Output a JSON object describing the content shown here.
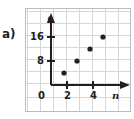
{
  "figure": {
    "part_label": "a)",
    "frame_color": "#b9bcc0",
    "grid_color": "#d5d7da",
    "axis_color": "#231f20",
    "point_color": "#231f20",
    "text_color": "#231f20"
  },
  "chart_data": {
    "type": "scatter",
    "title": "",
    "subtitle": "",
    "xlabel": "n",
    "ylabel": "t",
    "x": [
      1,
      2,
      3,
      4
    ],
    "values": [
      4,
      8,
      12,
      16
    ],
    "points": [
      {
        "n": 1,
        "t": 4
      },
      {
        "n": 2,
        "t": 8
      },
      {
        "n": 3,
        "t": 12
      },
      {
        "n": 4,
        "t": 16
      }
    ],
    "xlim": [
      0,
      5
    ],
    "ylim": [
      0,
      20
    ],
    "xticks": [
      0,
      2,
      4
    ],
    "xtick_labels": [
      "0",
      "2",
      "4"
    ],
    "yticks": [
      8,
      16
    ],
    "ytick_labels": [
      "8",
      "16"
    ],
    "grid": true,
    "grid_step_x": 1,
    "grid_step_y": 4,
    "legend": "none",
    "annotations": [
      "a)"
    ]
  },
  "axis_labels": {
    "x_name": "n",
    "y_name": "t",
    "origin": "0",
    "x_tick_2": "2",
    "x_tick_4": "4",
    "y_tick_8": "8",
    "y_tick_16": "16"
  }
}
